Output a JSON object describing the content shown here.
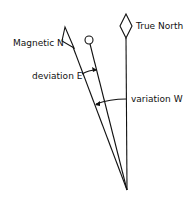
{
  "diagram": {
    "title": "",
    "labels": {
      "true_north": "True North",
      "magnetic_north": "Magnetic N",
      "deviation": "deviation E",
      "variation": "variation W"
    },
    "nodes": [
      {
        "id": "true-north-marker",
        "shape": "diamond",
        "x": 126,
        "y": 26
      },
      {
        "id": "magnetic-north-marker",
        "shape": "flag-triangle",
        "x": 68,
        "y": 38
      },
      {
        "id": "compass-north-marker",
        "shape": "circle",
        "x": 88,
        "y": 39
      },
      {
        "id": "origin",
        "shape": "point",
        "x": 127,
        "y": 190
      }
    ],
    "edges": [
      {
        "from": "origin",
        "to": "true-north-marker",
        "label": "True North"
      },
      {
        "from": "origin",
        "to": "magnetic-north-marker",
        "label": "Magnetic N"
      },
      {
        "from": "origin",
        "to": "compass-north-marker",
        "label": ""
      }
    ],
    "arcs": [
      {
        "label": "deviation E",
        "between": [
          "magnetic-north",
          "compass-north"
        ]
      },
      {
        "label": "variation W",
        "between": [
          "true-north",
          "magnetic-north"
        ]
      }
    ],
    "colors": {
      "line": "#111111",
      "background": "#ffffff"
    }
  }
}
